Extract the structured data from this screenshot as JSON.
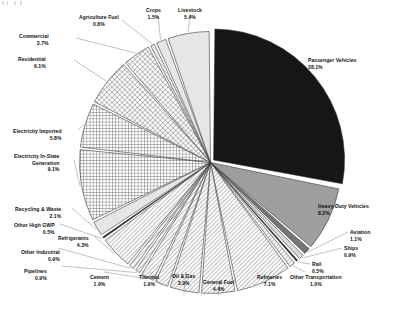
{
  "chart_data": {
    "type": "pie",
    "title": "",
    "subtitle": "",
    "xlabel": "",
    "ylabel": "",
    "legend_position": "callout-labels",
    "grid": false,
    "start_angle_deg": 0,
    "direction": "clockwise",
    "units": "percent",
    "categories": [
      "Passenger Vehicles",
      "Heavy-Duty Vehicles",
      "Aviation",
      "Ships",
      "Rail",
      "Other Transportation",
      "Refineries",
      "General Fuel",
      "Oil & Gas",
      "Thermal",
      "Cement",
      "Pipelines",
      "Other Industrial",
      "Refrigerants",
      "Other High GWP",
      "Recycling & Waste",
      "Electricity In-State Generation",
      "Electricity Imported",
      "Residential",
      "Commercial",
      "Agriculture Fuel",
      "Crops",
      "Livestock"
    ],
    "values": [
      28.1,
      8.2,
      1.1,
      0.9,
      0.5,
      1.0,
      7.1,
      4.4,
      3.9,
      1.9,
      1.9,
      0.9,
      0.9,
      4.3,
      0.5,
      2.1,
      9.1,
      5.8,
      6.1,
      3.7,
      0.8,
      1.5,
      5.4
    ],
    "slices": [
      {
        "label": "Passenger Vehicles",
        "value": 28.1,
        "value_text": "28.1%",
        "fill": "#161616",
        "pattern": "solid"
      },
      {
        "label": "Heavy-Duty Vehicles",
        "value": 8.2,
        "value_text": "8.2%",
        "fill": "#9a9a9a",
        "pattern": "solid-gray"
      },
      {
        "label": "Aviation",
        "value": 1.1,
        "value_text": "1.1%",
        "fill": "#6e6e6e",
        "pattern": "solid-gray-dark"
      },
      {
        "label": "Ships",
        "value": 0.9,
        "value_text": "0.9%",
        "fill": "#ffffff",
        "pattern": "diag-dense"
      },
      {
        "label": "Rail",
        "value": 0.5,
        "value_text": "0.5%",
        "fill": "#3a3a3a",
        "pattern": "solid-dark"
      },
      {
        "label": "Other Transportation",
        "value": 1.0,
        "value_text": "1.0%",
        "fill": "#ffffff",
        "pattern": "diag"
      },
      {
        "label": "Refineries",
        "value": 7.1,
        "value_text": "7.1%",
        "fill": "#ffffff",
        "pattern": "diag"
      },
      {
        "label": "General Fuel",
        "value": 4.4,
        "value_text": "4.4%",
        "fill": "#ffffff",
        "pattern": "diag"
      },
      {
        "label": "Oil & Gas",
        "value": 3.9,
        "value_text": "3.9%",
        "fill": "#ffffff",
        "pattern": "diag"
      },
      {
        "label": "Thermal",
        "value": 1.9,
        "value_text": "1.9%",
        "fill": "#ffffff",
        "pattern": "diag"
      },
      {
        "label": "Cement",
        "value": 1.9,
        "value_text": "1.9%",
        "fill": "#ffffff",
        "pattern": "diag"
      },
      {
        "label": "Pipelines",
        "value": 0.9,
        "value_text": "0.9%",
        "fill": "#ffffff",
        "pattern": "diag"
      },
      {
        "label": "Other Industrial",
        "value": 0.9,
        "value_text": "0.9%",
        "fill": "#ffffff",
        "pattern": "diag"
      },
      {
        "label": "Refrigerants",
        "value": 4.3,
        "value_text": "4.3%",
        "fill": "#ffffff",
        "pattern": "diag"
      },
      {
        "label": "Other High GWP",
        "value": 0.5,
        "value_text": "0.5%",
        "fill": "#2a2a2a",
        "pattern": "solid-dark"
      },
      {
        "label": "Recycling & Waste",
        "value": 2.1,
        "value_text": "2.1%",
        "fill": "#d8d8d8",
        "pattern": "light-gray"
      },
      {
        "label": "Electricity In-State Generation",
        "value": 9.1,
        "value_text": "9.1%",
        "fill": "#ffffff",
        "pattern": "grid"
      },
      {
        "label": "Electricity Imported",
        "value": 5.8,
        "value_text": "5.8%",
        "fill": "#ffffff",
        "pattern": "grid"
      },
      {
        "label": "Residential",
        "value": 6.1,
        "value_text": "6.1%",
        "fill": "#ffffff",
        "pattern": "cross-diag"
      },
      {
        "label": "Commercial",
        "value": 3.7,
        "value_text": "3.7%",
        "fill": "#ffffff",
        "pattern": "cross-diag"
      },
      {
        "label": "Agriculture Fuel",
        "value": 0.8,
        "value_text": "0.8%",
        "fill": "#ffffff",
        "pattern": "diag-fine"
      },
      {
        "label": "Crops",
        "value": 1.5,
        "value_text": "1.5%",
        "fill": "#e8e8e8",
        "pattern": "light-gray"
      },
      {
        "label": "Livestock",
        "value": 5.4,
        "value_text": "5.4%",
        "fill": "#e2e2e2",
        "pattern": "light-gray"
      }
    ]
  },
  "labels": {
    "passenger_vehicles": {
      "name": "Passenger Vehicles",
      "pct": "28.1%"
    },
    "heavy_duty_vehicles": {
      "name": "Heavy-Duty Vehicles",
      "pct": "8.2%"
    },
    "aviation": {
      "name": "Aviation",
      "pct": "1.1%"
    },
    "ships": {
      "name": "Ships",
      "pct": "0.9%"
    },
    "rail": {
      "name": "Rail",
      "pct": "0.5%"
    },
    "other_transportation": {
      "name": "Other Transportation",
      "pct": "1.0%"
    },
    "refineries": {
      "name": "Refineries",
      "pct": "7.1%"
    },
    "general_fuel": {
      "name": "General Fuel",
      "pct": "4.4%"
    },
    "oil_and_gas": {
      "name": "Oil & Gas",
      "pct": "3.9%"
    },
    "thermal": {
      "name": "Thermal",
      "pct": "1.9%"
    },
    "cement": {
      "name": "Cement",
      "pct": "1.9%"
    },
    "pipelines": {
      "name": "Pipelines",
      "pct": "0.9%"
    },
    "other_industrial": {
      "name": "Other Industrial",
      "pct": "0.9%"
    },
    "refrigerants": {
      "name": "Refrigerants",
      "pct": "4.3%"
    },
    "other_high_gwp": {
      "name": "Other High GWP",
      "pct": "0.5%"
    },
    "recycling_and_waste": {
      "name": "Recycling & Waste",
      "pct": "2.1%"
    },
    "electricity_instate_generation": {
      "name": "Electricity In-State",
      "name2": "Generation",
      "pct": "9.1%"
    },
    "electricity_imported": {
      "name": "Electricity Imported",
      "pct": "5.8%"
    },
    "residential": {
      "name": "Residential",
      "pct": "6.1%"
    },
    "commercial": {
      "name": "Commercial",
      "pct": "3.7%"
    },
    "agriculture_fuel": {
      "name": "Agriculture Fuel",
      "pct": "0.8%"
    },
    "crops": {
      "name": "Crops",
      "pct": "1.5%"
    },
    "livestock": {
      "name": "Livestock",
      "pct": "5.4%"
    }
  }
}
